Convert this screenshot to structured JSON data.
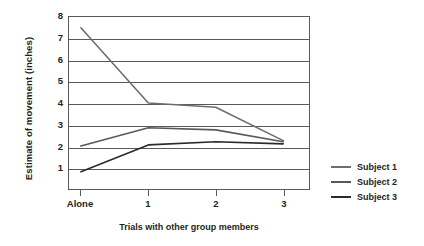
{
  "chart_data": {
    "type": "line",
    "title": "",
    "xlabel": "Trials with other group members",
    "ylabel": "Estimate of movement (inches)",
    "categories": [
      "Alone",
      "1",
      "2",
      "3"
    ],
    "series": [
      {
        "name": "Subject 1",
        "values": [
          7.5,
          4.0,
          3.8,
          2.25
        ],
        "color": "#6d6e71"
      },
      {
        "name": "Subject 2",
        "values": [
          2.0,
          2.85,
          2.75,
          2.2
        ],
        "color": "#58595b"
      },
      {
        "name": "Subject 3",
        "values": [
          0.8,
          2.05,
          2.2,
          2.1
        ],
        "color": "#2b2b2b"
      }
    ],
    "ylim": [
      0,
      8
    ],
    "yticks": [
      1,
      2,
      3,
      4,
      5,
      6,
      7,
      8
    ],
    "ytick_labels": [
      "1",
      "2",
      "3",
      "4",
      "5",
      "6",
      "7",
      "8"
    ],
    "grid": "horizontal",
    "legend_position": "right",
    "axis_color": "#58595b"
  },
  "legend": {
    "entries": [
      {
        "label": "Subject 1"
      },
      {
        "label": "Subject 2"
      },
      {
        "label": "Subject 3"
      }
    ]
  }
}
